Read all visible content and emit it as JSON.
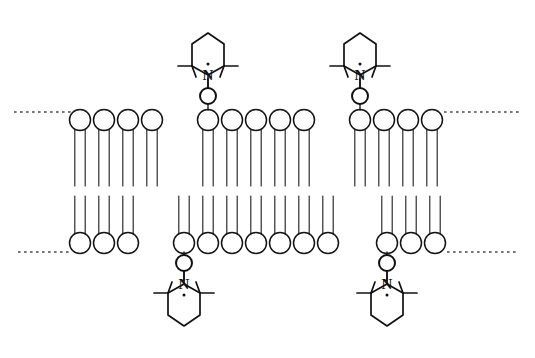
{
  "figure": {
    "background_color": "#ffffff",
    "line_color": "#181818",
    "dash_color": "#4a4a4a",
    "width": 535,
    "height": 358
  },
  "membrane": {
    "label": "lipid-bilayer",
    "lipid_count_per_leaflet": 13,
    "upper_leaflet": {
      "label": "upper-leaflet",
      "head_center_y": 120,
      "head_radius": 10.5,
      "tail_top_y": 129,
      "tail_bottom_y": 186,
      "tail_half_gap": 5.2,
      "x_positions": [
        80,
        104,
        128,
        152,
        208,
        232,
        256,
        280,
        304,
        360,
        384,
        408,
        432
      ],
      "lipid_index_labels": [
        "1",
        "2",
        "3",
        "4",
        "5",
        "6",
        "7",
        "8",
        "9",
        "10",
        "11",
        "12",
        "13"
      ]
    },
    "lower_leaflet": {
      "label": "lower-leaflet",
      "head_center_y": 243,
      "head_radius": 10.5,
      "tail_top_y": 196,
      "tail_bottom_y": 235,
      "tail_half_gap": 5.2,
      "x_positions": [
        80,
        104,
        128,
        184,
        208,
        232,
        256,
        280,
        304,
        328,
        387,
        411,
        435
      ],
      "lipid_index_labels": [
        "1",
        "2",
        "3",
        "4",
        "5",
        "6",
        "7",
        "8",
        "9",
        "10",
        "11",
        "12",
        "13"
      ]
    },
    "surface_lines": [
      {
        "name": "upper-surface-dotted-line-left",
        "y": 112,
        "x_start": 14,
        "x_end": 72
      },
      {
        "name": "upper-surface-dotted-line-right",
        "y": 112,
        "x_start": 444,
        "x_end": 521
      },
      {
        "name": "lower-surface-dotted-line-left",
        "y": 252,
        "x_start": 18,
        "x_end": 71
      },
      {
        "name": "lower-surface-dotted-line-right",
        "y": 252,
        "x_start": 447,
        "x_end": 519
      }
    ]
  },
  "spin_labels": [
    {
      "name": "spin-label-top-left",
      "orientation": "up",
      "attachment_lipid_index": 5,
      "attachment_x": 208,
      "attachment_y": 110,
      "stem_top_y": 76,
      "ring_center_x": 208,
      "ring_center_y": 55,
      "nitrogen_label": "N",
      "oxygen_label": "O",
      "oxygen_style": "open-circle",
      "radical_dot": true,
      "methyl_count": 4
    },
    {
      "name": "spin-label-top-right",
      "orientation": "up",
      "attachment_lipid_index": 10,
      "attachment_x": 360,
      "attachment_y": 110,
      "stem_top_y": 76,
      "ring_center_x": 360,
      "ring_center_y": 55,
      "nitrogen_label": "N",
      "oxygen_label": "O",
      "oxygen_style": "open-circle",
      "radical_dot": true,
      "methyl_count": 4
    },
    {
      "name": "spin-label-bottom-left",
      "orientation": "down",
      "attachment_lipid_index": 4,
      "attachment_x": 184,
      "attachment_y": 252,
      "stem_bottom_y": 283,
      "ring_center_x": 184,
      "ring_center_y": 304,
      "nitrogen_label": "N",
      "oxygen_label": "O",
      "oxygen_style": "open-circle",
      "radical_dot": true,
      "methyl_count": 4
    },
    {
      "name": "spin-label-bottom-right",
      "orientation": "down",
      "attachment_lipid_index": 11,
      "attachment_x": 387,
      "attachment_y": 252,
      "stem_bottom_y": 283,
      "ring_center_x": 387,
      "ring_center_y": 304,
      "nitrogen_label": "N",
      "oxygen_label": "O",
      "oxygen_style": "open-circle",
      "radical_dot": true,
      "methyl_count": 4
    }
  ]
}
